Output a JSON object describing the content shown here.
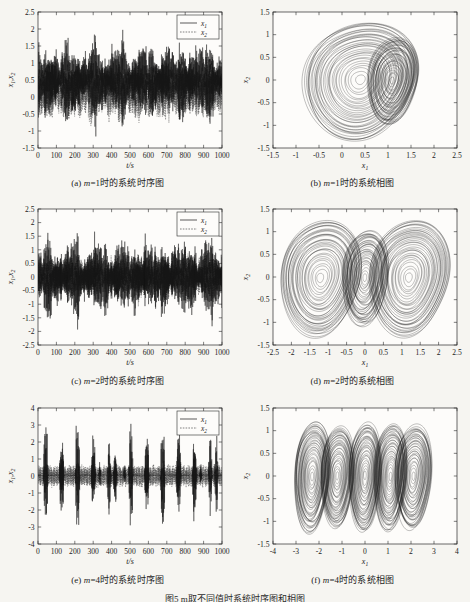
{
  "figure": {
    "background": "#f6f5f1",
    "bottom_caption": "图5  m取不同值时系统时序图和相图",
    "panels": [
      {
        "id": "a",
        "caption_prefix": "(a)",
        "caption_math": "m",
        "caption_text": "=1时的系统时序图",
        "type": "timeseries",
        "m": 1
      },
      {
        "id": "b",
        "caption_prefix": "(b)",
        "caption_math": "m",
        "caption_text": "=1时的系统相图",
        "type": "phase",
        "m": 1
      },
      {
        "id": "c",
        "caption_prefix": "(c)",
        "caption_math": "m",
        "caption_text": "=2时的系统时序图",
        "type": "timeseries",
        "m": 2
      },
      {
        "id": "d",
        "caption_prefix": "(d)",
        "caption_math": "m",
        "caption_text": "=2时的系统相图",
        "type": "phase",
        "m": 2
      },
      {
        "id": "e",
        "caption_prefix": "(e)",
        "caption_math": "m",
        "caption_text": "=4时的系统时序图",
        "type": "timeseries",
        "m": 4
      },
      {
        "id": "f",
        "caption_prefix": "(f)",
        "caption_math": "m",
        "caption_text": "=4时的系统相图",
        "type": "phase",
        "m": 4
      }
    ]
  },
  "chart_data": [
    {
      "panel": "a",
      "type": "line",
      "title": "(a) m=1时的系统时序图",
      "xlabel": "t/s",
      "ylabel": "x1,x2",
      "xlim": [
        0,
        1000
      ],
      "ylim": [
        -1.5,
        2.5
      ],
      "xticks": [
        0,
        100,
        200,
        300,
        400,
        500,
        600,
        700,
        800,
        900,
        1000
      ],
      "yticks": [
        -1.5,
        -1,
        -0.5,
        0,
        0.5,
        1,
        1.5,
        2,
        2.5
      ],
      "grid": false,
      "legend": [
        "x1",
        "x2"
      ],
      "legend_position": "upper right",
      "series": [
        {
          "name": "x1",
          "style": "solid",
          "envelope_min": -1.35,
          "envelope_max": 2.3,
          "mean": 0.52,
          "description": "chaotic oscillation around single scroll centered near 0.5, bursts to 2.3"
        },
        {
          "name": "x2",
          "style": "dashed",
          "envelope_min": -1.2,
          "envelope_max": 1.6,
          "mean": 0.1,
          "description": "chaotic oscillation, smaller amplitude, centered near 0.1"
        }
      ]
    },
    {
      "panel": "b",
      "type": "line",
      "title": "(b) m=1时的系统相图",
      "xlabel": "x1",
      "ylabel": "x2",
      "xlim": [
        -1.5,
        2.5
      ],
      "ylim": [
        -1.5,
        1.5
      ],
      "xticks": [
        -1.5,
        -1,
        -0.5,
        0,
        0.5,
        1,
        1.5,
        2,
        2.5
      ],
      "yticks": [
        -1.5,
        -1,
        -0.5,
        0,
        0.5,
        1,
        1.5
      ],
      "grid": false,
      "legend": [],
      "attractor": {
        "scrolls": 2,
        "centers": [
          [
            0.4,
            0.0
          ],
          [
            1.1,
            0.0
          ]
        ],
        "radii_x": [
          1.25,
          0.55
        ],
        "radii_y": [
          1.3,
          0.95
        ],
        "description": "two overlapping scroll rings, large left scroll and smaller right scroll"
      }
    },
    {
      "panel": "c",
      "type": "line",
      "title": "(c) m=2时的系统时序图",
      "xlabel": "t/s",
      "ylabel": "x1,x2",
      "xlim": [
        0,
        1000
      ],
      "ylim": [
        -2.5,
        2.5
      ],
      "xticks": [
        0,
        100,
        200,
        300,
        400,
        500,
        600,
        700,
        800,
        900,
        1000
      ],
      "yticks": [
        -2.5,
        -2,
        -1.5,
        -1,
        -0.5,
        0,
        0.5,
        1,
        1.5,
        2,
        2.5
      ],
      "grid": false,
      "legend": [
        "x1",
        "x2"
      ],
      "legend_position": "upper right",
      "series": [
        {
          "name": "x1",
          "style": "solid",
          "envelope_min": -2.25,
          "envelope_max": 2.25,
          "mean": 0.0,
          "description": "symmetric chaotic oscillation spanning full range"
        },
        {
          "name": "x2",
          "style": "dashed",
          "envelope_min": -1.3,
          "envelope_max": 1.3,
          "mean": 0.0,
          "description": "symmetric chaotic oscillation, smaller amplitude"
        }
      ]
    },
    {
      "panel": "d",
      "type": "line",
      "title": "(d) m=2时的系统相图",
      "xlabel": "x1",
      "ylabel": "x2",
      "xlim": [
        -2.5,
        2.5
      ],
      "ylim": [
        -1.5,
        1.5
      ],
      "xticks": [
        -2.5,
        -2,
        -1.5,
        -1,
        -0.5,
        0,
        0.5,
        1,
        1.5,
        2,
        2.5
      ],
      "yticks": [
        -1.5,
        -1,
        -0.5,
        0,
        0.5,
        1,
        1.5
      ],
      "grid": false,
      "legend": [],
      "attractor": {
        "scrolls": 3,
        "centers": [
          [
            -1.2,
            0.0
          ],
          [
            0.0,
            0.0
          ],
          [
            1.2,
            0.0
          ]
        ],
        "radii_x": [
          1.1,
          0.62,
          1.1
        ],
        "radii_y": [
          1.28,
          1.05,
          1.28
        ],
        "description": "three-scroll symmetric attractor, outer scrolls larger"
      }
    },
    {
      "panel": "e",
      "type": "line",
      "title": "(e) m=4时的系统时序图",
      "xlabel": "t/s",
      "ylabel": "x1,x2",
      "xlim": [
        0,
        1000
      ],
      "ylim": [
        -4,
        4
      ],
      "xticks": [
        0,
        100,
        200,
        300,
        400,
        500,
        600,
        700,
        800,
        900,
        1000
      ],
      "yticks": [
        -4,
        -3,
        -2,
        -1,
        0,
        1,
        2,
        3,
        4
      ],
      "grid": false,
      "legend": [
        "x1",
        "x2"
      ],
      "legend_position": "upper right",
      "series": [
        {
          "name": "x1",
          "style": "solid",
          "envelope_min": -3.1,
          "envelope_max": 3.15,
          "mean": 0.05,
          "description": "intermittent chaotic bursts, long quiescent intervals near 0"
        },
        {
          "name": "x2",
          "style": "dashed",
          "envelope_min": -0.95,
          "envelope_max": 0.95,
          "mean": 0.0,
          "description": "small amplitude fast oscillation"
        }
      ]
    },
    {
      "panel": "f",
      "type": "line",
      "title": "(f) m=4时的系统相图",
      "xlabel": "x1",
      "ylabel": "x2",
      "xlim": [
        -4,
        4
      ],
      "ylim": [
        -1.5,
        1.5
      ],
      "xticks": [
        -4,
        -3,
        -2,
        -1,
        0,
        1,
        2,
        3,
        4
      ],
      "yticks": [
        -1.5,
        -1,
        -0.5,
        0,
        0.5,
        1,
        1.5
      ],
      "grid": false,
      "legend": [],
      "attractor": {
        "scrolls": 5,
        "centers": [
          [
            -2.3,
            0.0
          ],
          [
            -1.2,
            0.0
          ],
          [
            0.0,
            0.0
          ],
          [
            1.1,
            0.0
          ],
          [
            2.1,
            0.0
          ]
        ],
        "radii_x": [
          0.78,
          0.72,
          0.7,
          0.72,
          0.8
        ],
        "radii_y": [
          1.22,
          1.12,
          1.2,
          1.18,
          1.15
        ],
        "description": "five-scroll multi-scroll attractor arranged horizontally"
      }
    }
  ]
}
